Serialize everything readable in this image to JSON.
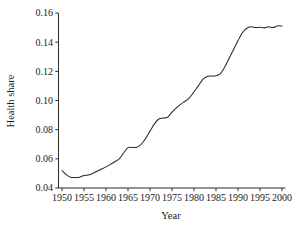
{
  "chart_data": {
    "type": "line",
    "title": "",
    "xlabel": "Year",
    "ylabel": "Health share",
    "xlim": [
      1949.2,
      2000.8
    ],
    "ylim": [
      0.04,
      0.16
    ],
    "grid": false,
    "legend": null,
    "line_color": "#2b2b2b",
    "xticks": [
      1950,
      1955,
      1960,
      1965,
      1970,
      1975,
      1980,
      1985,
      1990,
      1995,
      2000
    ],
    "xtick_labels": [
      "1950",
      "1955",
      "1960",
      "1965",
      "1970",
      "1975",
      "1980",
      "1985",
      "1990",
      "1995",
      "2000"
    ],
    "yticks": [
      0.04,
      0.06,
      0.08,
      0.1,
      0.12,
      0.14,
      0.16
    ],
    "ytick_labels": [
      "0.04",
      "0.06",
      "0.08",
      "0.10",
      "0.12",
      "0.14",
      "0.16"
    ],
    "series": [
      {
        "name": "Health share",
        "x": [
          1950,
          1951,
          1952,
          1953,
          1954,
          1955,
          1956,
          1957,
          1958,
          1959,
          1960,
          1961,
          1962,
          1963,
          1964,
          1965,
          1966,
          1967,
          1968,
          1969,
          1970,
          1971,
          1972,
          1973,
          1974,
          1975,
          1976,
          1977,
          1978,
          1979,
          1980,
          1981,
          1982,
          1983,
          1984,
          1985,
          1986,
          1987,
          1988,
          1989,
          1990,
          1991,
          1992,
          1993,
          1994,
          1995,
          1996,
          1997,
          1998,
          1999,
          2000
        ],
        "values": [
          0.052,
          0.049,
          0.0473,
          0.0472,
          0.0474,
          0.0486,
          0.0489,
          0.05,
          0.0516,
          0.053,
          0.0545,
          0.0562,
          0.058,
          0.06,
          0.064,
          0.0677,
          0.0678,
          0.0679,
          0.07,
          0.074,
          0.079,
          0.084,
          0.0873,
          0.088,
          0.0885,
          0.092,
          0.095,
          0.0975,
          0.0995,
          0.102,
          0.106,
          0.11,
          0.1145,
          0.1165,
          0.1168,
          0.117,
          0.1185,
          0.123,
          0.129,
          0.135,
          0.141,
          0.1465,
          0.1495,
          0.1505,
          0.15,
          0.1502,
          0.1498,
          0.1505,
          0.15,
          0.1512,
          0.151
        ]
      }
    ]
  }
}
